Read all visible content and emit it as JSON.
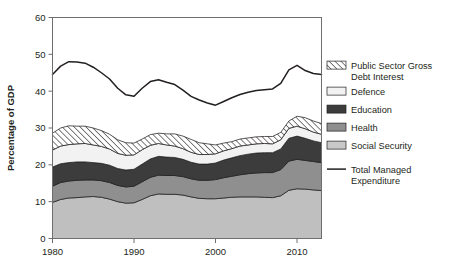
{
  "chart_data": {
    "type": "area",
    "title": "",
    "subtitle": "",
    "xlabel": "",
    "ylabel": "Percentage of GDP",
    "xlim": [
      1980,
      2013
    ],
    "ylim": [
      0,
      60
    ],
    "grid": false,
    "stacked": true,
    "legend_position": "right",
    "xticks": [
      1980,
      1990,
      2000,
      2010
    ],
    "xtick_labels": [
      "1980",
      "1990",
      "2000",
      "2010"
    ],
    "yticks": [
      0,
      10,
      20,
      30,
      40,
      50,
      60
    ],
    "ytick_labels": [
      "0",
      "10",
      "20",
      "30",
      "40",
      "50",
      "60"
    ],
    "x": [
      1980,
      1981,
      1982,
      1983,
      1984,
      1985,
      1986,
      1987,
      1988,
      1989,
      1990,
      1991,
      1992,
      1993,
      1994,
      1995,
      1996,
      1997,
      1998,
      1999,
      2000,
      2001,
      2002,
      2003,
      2004,
      2005,
      2006,
      2007,
      2008,
      2009,
      2010,
      2011,
      2012,
      2013
    ],
    "stack_order_bottom_to_top": [
      "Social Security",
      "Health",
      "Education",
      "Defence",
      "Public Sector Gross Debt Interest"
    ],
    "series": [
      {
        "name": "Social Security",
        "color": "#bfbfbf",
        "values": [
          9.8,
          10.6,
          11.0,
          11.1,
          11.3,
          11.4,
          11.2,
          10.7,
          10.0,
          9.6,
          9.7,
          10.6,
          11.6,
          12.1,
          12.0,
          12.0,
          11.8,
          11.3,
          10.9,
          10.8,
          10.8,
          11.0,
          11.2,
          11.3,
          11.3,
          11.3,
          11.2,
          11.1,
          11.6,
          13.1,
          13.5,
          13.4,
          13.2,
          13.0
        ]
      },
      {
        "name": "Health",
        "color": "#8f8f8f",
        "values": [
          4.4,
          4.6,
          4.6,
          4.7,
          4.6,
          4.5,
          4.5,
          4.5,
          4.4,
          4.4,
          4.5,
          4.8,
          5.0,
          5.1,
          5.1,
          5.1,
          5.0,
          4.9,
          4.9,
          5.0,
          5.2,
          5.5,
          5.7,
          6.0,
          6.3,
          6.5,
          6.7,
          6.8,
          7.1,
          7.9,
          8.0,
          7.8,
          7.7,
          7.6
        ]
      },
      {
        "name": "Education",
        "color": "#3c3c3c",
        "values": [
          5.2,
          5.1,
          5.0,
          5.0,
          4.9,
          4.7,
          4.7,
          4.7,
          4.6,
          4.6,
          4.6,
          4.8,
          5.0,
          5.1,
          5.0,
          4.9,
          4.7,
          4.5,
          4.4,
          4.4,
          4.5,
          4.8,
          5.0,
          5.2,
          5.3,
          5.4,
          5.4,
          5.4,
          5.6,
          6.2,
          6.3,
          6.0,
          5.6,
          5.4
        ]
      },
      {
        "name": "Defence",
        "color": "#f2f2f2",
        "values": [
          4.6,
          4.8,
          4.9,
          4.9,
          5.0,
          4.8,
          4.6,
          4.4,
          4.1,
          4.0,
          3.9,
          3.9,
          3.7,
          3.5,
          3.3,
          3.1,
          2.9,
          2.7,
          2.6,
          2.6,
          2.5,
          2.5,
          2.5,
          2.6,
          2.5,
          2.5,
          2.5,
          2.4,
          2.5,
          2.7,
          2.7,
          2.6,
          2.4,
          2.3
        ]
      },
      {
        "name": "Public Sector Gross Debt Interest",
        "color": "#ffffff",
        "pattern": "diagonal-hatch",
        "values": [
          4.6,
          4.9,
          5.1,
          4.8,
          4.7,
          4.6,
          4.3,
          4.0,
          3.7,
          3.4,
          3.2,
          2.9,
          2.9,
          2.8,
          3.0,
          3.3,
          3.4,
          3.5,
          3.2,
          2.9,
          2.4,
          2.1,
          1.9,
          1.9,
          1.9,
          1.9,
          1.9,
          2.0,
          2.0,
          2.0,
          2.7,
          3.0,
          3.0,
          2.9
        ]
      }
    ],
    "line_series": {
      "name": "Total Managed Expenditure",
      "color": "#231f20",
      "values": [
        44.5,
        46.8,
        48.0,
        47.9,
        47.6,
        46.5,
        45.0,
        43.3,
        40.8,
        39.0,
        38.6,
        40.8,
        42.6,
        43.1,
        42.4,
        41.8,
        40.3,
        38.6,
        37.6,
        36.8,
        36.2,
        37.2,
        38.2,
        39.1,
        39.7,
        40.2,
        40.4,
        40.6,
        42.1,
        45.8,
        47.0,
        45.6,
        44.8,
        44.5
      ]
    }
  },
  "axes": {
    "ylabel": "Percentage of GDP"
  },
  "legend": {
    "items": [
      {
        "label_line1": "Public Sector Gross",
        "label_line2": "Debt Interest",
        "swatch": "hatch"
      },
      {
        "label_line1": "Defence",
        "label_line2": "",
        "swatch": "defence"
      },
      {
        "label_line1": "Education",
        "label_line2": "",
        "swatch": "education"
      },
      {
        "label_line1": "Health",
        "label_line2": "",
        "swatch": "health"
      },
      {
        "label_line1": "Social Security",
        "label_line2": "",
        "swatch": "social"
      },
      {
        "label_line1": "Total Managed",
        "label_line2": "Expenditure",
        "swatch": "line"
      }
    ]
  }
}
